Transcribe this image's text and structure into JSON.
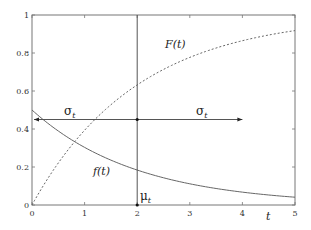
{
  "chart_data": {
    "type": "line",
    "title": "",
    "xlabel": "t",
    "ylabel": "",
    "xlim": [
      0,
      5
    ],
    "ylim": [
      0,
      1
    ],
    "grid": false,
    "x_ticks": [
      "0",
      "1",
      "2",
      "3",
      "4",
      "5"
    ],
    "y_ticks": [
      "0",
      "0.2",
      "0.4",
      "0.6",
      "0.8",
      "1"
    ],
    "series": [
      {
        "name": "f(t)",
        "style": "solid",
        "x": [
          0,
          0.5,
          1,
          1.5,
          2,
          2.5,
          3,
          3.5,
          4,
          4.5,
          5
        ],
        "values": [
          0.5,
          0.389,
          0.303,
          0.236,
          0.184,
          0.143,
          0.112,
          0.087,
          0.068,
          0.053,
          0.041
        ]
      },
      {
        "name": "F(t)",
        "style": "dashed",
        "x": [
          0,
          0.5,
          1,
          1.5,
          2,
          2.5,
          3,
          3.5,
          4,
          4.5,
          5
        ],
        "values": [
          0,
          0.221,
          0.393,
          0.528,
          0.632,
          0.713,
          0.777,
          0.826,
          0.865,
          0.895,
          0.918
        ]
      }
    ],
    "annotations": [
      {
        "text": "F(t)",
        "x": 2.5,
        "y": 0.84
      },
      {
        "text": "f(t)",
        "x": 1.3,
        "y": 0.13
      },
      {
        "text": "σ",
        "subscript": "t",
        "x": 0.55,
        "y": 0.48,
        "type": "arrow-left",
        "from": 2,
        "to": 0,
        "at_y": 0.45
      },
      {
        "text": "σ",
        "subscript": "t",
        "x": 3.1,
        "y": 0.48,
        "type": "arrow-right",
        "from": 2,
        "to": 4,
        "at_y": 0.45
      },
      {
        "text": "μ",
        "subscript": "t",
        "x": 2.05,
        "y": 0.03,
        "type": "vertical-line",
        "at_x": 2
      }
    ]
  },
  "labels": {
    "F": "F(t)",
    "f": "f(t)",
    "sigma": "σ",
    "sigma_sub": "t",
    "mu": "μ",
    "mu_sub": "t",
    "xlabel": "t"
  }
}
